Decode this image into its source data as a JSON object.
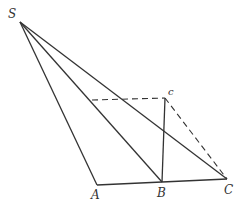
{
  "diagram": {
    "type": "geometry",
    "points": {
      "S": {
        "label": "S",
        "x": 20,
        "y": 22
      },
      "A": {
        "label": "A",
        "x": 97,
        "y": 185
      },
      "B": {
        "label": "B",
        "x": 162,
        "y": 182
      },
      "C": {
        "label": "C",
        "x": 227,
        "y": 179
      },
      "c": {
        "label": "c",
        "x": 165,
        "y": 98
      },
      "D": {
        "label": "",
        "x": 92,
        "y": 100
      }
    },
    "solid_segments": [
      "SA",
      "SB",
      "SC",
      "AC",
      "Bc"
    ],
    "dashed_segments": [
      "Dc",
      "cC"
    ],
    "colors": {
      "line": "#333333",
      "background": "#ffffff"
    }
  }
}
